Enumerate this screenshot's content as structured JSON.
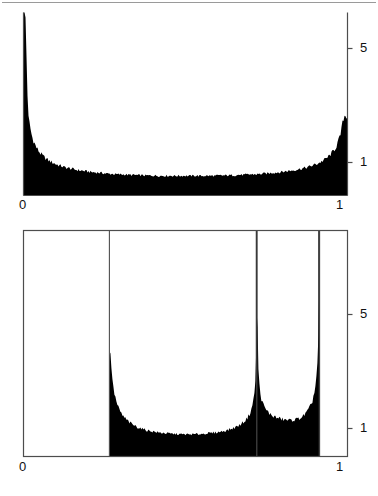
{
  "page": {
    "kind": "two-panel-histogram-figure",
    "background_color": "#ffffff",
    "ink_color": "#000000",
    "axis_color": "#4d4d4d",
    "rule_color": "#9a9a9a"
  },
  "top_panel": {
    "x_ticks": [
      "0",
      "1"
    ],
    "y_ticks": [
      "5",
      "1"
    ]
  },
  "bottom_panel": {
    "x_ticks": [
      "0",
      "1"
    ],
    "y_ticks": [
      "5",
      "1"
    ]
  },
  "chart_data": [
    {
      "id": "top-histogram",
      "type": "area",
      "title": "",
      "subtitle": "",
      "xlabel": "",
      "ylabel": "",
      "xlim": [
        0,
        1
      ],
      "ylim": [
        0,
        6.2
      ],
      "xtick_values": [
        0,
        1
      ],
      "xtick_labels": [
        "0",
        "1"
      ],
      "ytick_values": [
        1,
        5
      ],
      "ytick_labels": [
        "1",
        "5"
      ],
      "grid": false,
      "legend": null,
      "axis_style": "left-spine-and-right-spine, baseline",
      "description": "Simulated histogram of an arcsine / Beta(0.5,0.5) density on [0,1]: symmetric U shape diverging at both endpoints, flat minimum near 0.64 in the middle.",
      "density_model": "beta(0.5,0.5): f(x)=1/(pi*sqrt(x*(1-x)))",
      "noise_amplitude": 0.055,
      "n_bins": 320,
      "x": [
        0.0016,
        0.0141,
        0.0266,
        0.0391,
        0.0516,
        0.0641,
        0.0766,
        0.0891,
        0.1016,
        0.1141,
        0.1266,
        0.1391,
        0.1516,
        0.1641,
        0.1766,
        0.1891,
        0.2016,
        0.2141,
        0.2266,
        0.2391,
        0.2516,
        0.2641,
        0.2766,
        0.2891,
        0.3016,
        0.3141,
        0.3266,
        0.3391,
        0.3516,
        0.3641,
        0.3766,
        0.3891,
        0.4016,
        0.4141,
        0.4266,
        0.4391,
        0.4516,
        0.4641,
        0.4766,
        0.4891,
        0.5016,
        0.5141,
        0.5266,
        0.5391,
        0.5516,
        0.5641,
        0.5766,
        0.5891,
        0.6016,
        0.6141,
        0.6266,
        0.6391,
        0.6516,
        0.6641,
        0.6766,
        0.6891,
        0.7016,
        0.7141,
        0.7266,
        0.7391,
        0.7516,
        0.7641,
        0.7766,
        0.7891,
        0.8016,
        0.8141,
        0.8266,
        0.8391,
        0.8516,
        0.8641,
        0.8766,
        0.8891,
        0.9016,
        0.9141,
        0.9266,
        0.9391,
        0.9516,
        0.9641,
        0.9766,
        0.9891
      ],
      "values": [
        7.96,
        2.71,
        1.98,
        1.64,
        1.44,
        1.3,
        1.2,
        1.12,
        1.06,
        1.01,
        0.96,
        0.93,
        0.9,
        0.87,
        0.85,
        0.83,
        0.81,
        0.79,
        0.78,
        0.77,
        0.75,
        0.74,
        0.73,
        0.72,
        0.72,
        0.71,
        0.7,
        0.7,
        0.69,
        0.69,
        0.68,
        0.68,
        0.68,
        0.67,
        0.67,
        0.67,
        0.67,
        0.67,
        0.67,
        0.67,
        0.67,
        0.67,
        0.67,
        0.67,
        0.67,
        0.67,
        0.67,
        0.67,
        0.68,
        0.68,
        0.68,
        0.69,
        0.69,
        0.7,
        0.7,
        0.71,
        0.72,
        0.72,
        0.73,
        0.74,
        0.75,
        0.77,
        0.78,
        0.79,
        0.81,
        0.83,
        0.85,
        0.87,
        0.9,
        0.93,
        0.96,
        1.01,
        1.06,
        1.12,
        1.2,
        1.3,
        1.44,
        1.64,
        1.98,
        2.71
      ]
    },
    {
      "id": "bottom-histogram",
      "type": "area",
      "title": "",
      "subtitle": "",
      "xlabel": "",
      "ylabel": "",
      "xlim": [
        0,
        1
      ],
      "ylim": [
        0,
        6.4
      ],
      "xtick_values": [
        0,
        1
      ],
      "xtick_labels": [
        "0",
        "1"
      ],
      "ytick_values": [
        1,
        5
      ],
      "ytick_labels": [
        "1",
        "5"
      ],
      "grid": false,
      "legend": null,
      "axis_style": "full box frame with interior vertical rules",
      "frame_vertical_rules_x": [
        0.265,
        0.72,
        0.913
      ],
      "support": [
        0.265,
        0.913
      ],
      "description": "Histogram supported only on [0.265,0.913]; density is zero outside. Two U-shaped lobes separated by a tall narrow interior spike at x=0.72; second lobe runs from 0.72 to the right edge 0.913 where it also diverges.",
      "n_bins": 210,
      "x": [
        0.268,
        0.277,
        0.287,
        0.296,
        0.306,
        0.315,
        0.325,
        0.334,
        0.344,
        0.353,
        0.363,
        0.372,
        0.382,
        0.391,
        0.401,
        0.41,
        0.42,
        0.429,
        0.439,
        0.448,
        0.458,
        0.467,
        0.477,
        0.486,
        0.496,
        0.505,
        0.515,
        0.524,
        0.534,
        0.543,
        0.553,
        0.562,
        0.572,
        0.581,
        0.591,
        0.6,
        0.61,
        0.619,
        0.629,
        0.638,
        0.648,
        0.657,
        0.667,
        0.676,
        0.686,
        0.695,
        0.7,
        0.705,
        0.71,
        0.714,
        0.717,
        0.719,
        0.72,
        0.722,
        0.724,
        0.727,
        0.731,
        0.736,
        0.742,
        0.75,
        0.76,
        0.771,
        0.783,
        0.795,
        0.807,
        0.818,
        0.829,
        0.84,
        0.85,
        0.86,
        0.869,
        0.877,
        0.885,
        0.892,
        0.898,
        0.903,
        0.907,
        0.91,
        0.912,
        0.913
      ],
      "values": [
        3.6,
        2.4,
        1.9,
        1.62,
        1.44,
        1.32,
        1.22,
        1.14,
        1.08,
        1.03,
        0.99,
        0.95,
        0.92,
        0.9,
        0.88,
        0.86,
        0.84,
        0.83,
        0.82,
        0.81,
        0.8,
        0.79,
        0.79,
        0.78,
        0.78,
        0.78,
        0.78,
        0.78,
        0.79,
        0.79,
        0.8,
        0.81,
        0.82,
        0.83,
        0.84,
        0.86,
        0.88,
        0.9,
        0.93,
        0.96,
        1.0,
        1.05,
        1.11,
        1.19,
        1.29,
        1.44,
        1.56,
        1.74,
        2.0,
        2.4,
        3.0,
        4.2,
        6.3,
        4.6,
        3.3,
        2.6,
        2.2,
        1.94,
        1.76,
        1.62,
        1.5,
        1.42,
        1.36,
        1.32,
        1.29,
        1.28,
        1.28,
        1.3,
        1.34,
        1.4,
        1.49,
        1.6,
        1.76,
        1.98,
        2.28,
        2.7,
        3.3,
        4.2,
        5.4,
        6.3
      ]
    }
  ]
}
